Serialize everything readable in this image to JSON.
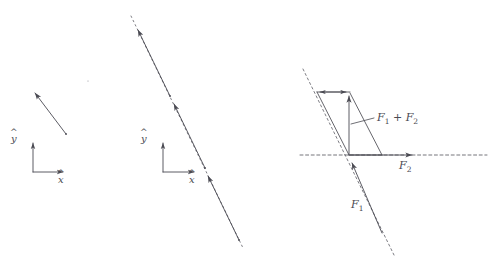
{
  "figure": {
    "title": "",
    "background": "#ffffff",
    "stroke_color": "#4a4a52",
    "panels": [
      {
        "id": "panel-single-vector",
        "name": "single force vector with reference frame",
        "axes": {
          "origin": [
            33,
            172
          ],
          "x_label": "x",
          "x_hat": "^",
          "y_label": "y",
          "y_hat": "^",
          "x_tip": [
            66,
            172
          ],
          "y_tip": [
            33,
            140
          ]
        },
        "vectors": [
          {
            "name": "force-arrow",
            "from": [
              66,
              134
            ],
            "to": [
              33,
              90
            ],
            "style": "solid",
            "arrow": "end"
          }
        ]
      },
      {
        "id": "panel-line-of-action",
        "name": "sliding vectors along dashed line of action",
        "axes": {
          "origin": [
            163,
            172
          ],
          "x_label": "x",
          "x_hat": "^",
          "y_label": "y",
          "y_hat": "^",
          "x_tip": [
            197,
            172
          ],
          "y_tip": [
            163,
            140
          ]
        },
        "line_of_action": {
          "from": [
            131,
            16
          ],
          "to": [
            243,
            248
          ],
          "style": "dashed"
        },
        "vectors": [
          {
            "name": "sliding-vector-1",
            "from": [
              170,
              96
            ],
            "to": [
              136,
              26
            ],
            "style": "solid",
            "arrow": "end"
          },
          {
            "name": "sliding-vector-2",
            "from": [
              205,
              168
            ],
            "to": [
              172,
              100
            ],
            "style": "solid",
            "arrow": "end"
          },
          {
            "name": "sliding-vector-3",
            "from": [
              239,
              240
            ],
            "to": [
              206,
              172
            ],
            "style": "solid",
            "arrow": "end"
          }
        ]
      },
      {
        "id": "panel-parallelogram",
        "name": "parallelogram law of force addition",
        "origin": [
          349,
          155
        ],
        "dashed_lines": [
          {
            "name": "horizontal-line-of-action",
            "from": [
              300,
              155
            ],
            "to": [
              487,
              155
            ],
            "style": "dashed"
          },
          {
            "name": "diagonal-line-of-action",
            "from": [
              303,
              69
            ],
            "to": [
              394,
              255
            ],
            "style": "dashed"
          }
        ],
        "vectors": [
          {
            "name": "f2-vector",
            "label": "F2",
            "from": [
              349,
              155
            ],
            "to": [
              415,
              155
            ],
            "style": "solid",
            "arrow": "end"
          },
          {
            "name": "f1-vector",
            "label": "F1",
            "from": [
              382,
              233
            ],
            "to": [
              351,
              161
            ],
            "style": "solid",
            "arrow": "end"
          },
          {
            "name": "resultant-vector",
            "label": "F1 + F2",
            "from": [
              349,
              155
            ],
            "to": [
              349,
              93
            ],
            "style": "solid",
            "arrow": "end"
          },
          {
            "name": "f1-translated-top",
            "from": [
              350,
              92
            ],
            "to": [
              318,
              92
            ],
            "style": "solid",
            "arrow": "end"
          },
          {
            "name": "f2-translated-top",
            "from": [
              317,
              92
            ],
            "to": [
              349,
              92
            ],
            "style": "solid",
            "arrow": "end"
          }
        ],
        "parallelogram_edges": [
          {
            "name": "edge-left",
            "from": [
              349,
              155
            ],
            "to": [
              317,
              92
            ]
          },
          {
            "name": "edge-right",
            "from": [
              382,
              155
            ],
            "to": [
              349,
              92
            ]
          }
        ],
        "labels": {
          "resultant": "F1 + F2",
          "resultant_display": "ℱ1 + ℱ2",
          "f2": "ℱ2",
          "f1": "ℱ1",
          "leader_line": {
            "from": [
              351,
              124
            ],
            "to": [
              375,
              118
            ]
          }
        }
      }
    ],
    "text": {
      "x_hat_left": "x",
      "y_hat_left": "y",
      "x_hat_mid": "x",
      "y_hat_mid": "y",
      "resultant_F": "F",
      "resultant_sub1": "1",
      "plus": "+",
      "resultant_sub2": "2",
      "f2_F": "F",
      "f2_sub": "2",
      "f1_F": "F",
      "f1_sub": "1"
    }
  }
}
